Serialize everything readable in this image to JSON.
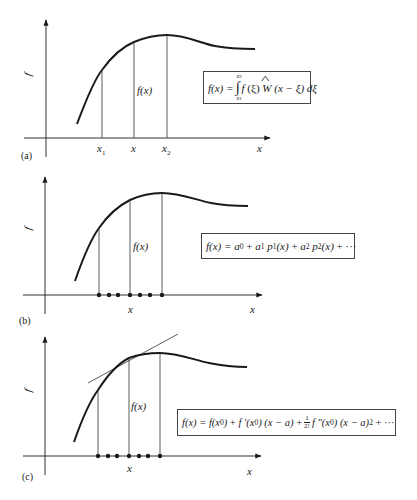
{
  "figure": {
    "panels": [
      {
        "id": "a",
        "panel_label": "(a)",
        "y_axis_label": "f",
        "x_axis_label": "x",
        "curve_label": "f(x)",
        "tick_labels": [
          "x1",
          "x",
          "x2"
        ],
        "tick_label_parts": [
          {
            "base": "x",
            "sub": "1"
          },
          {
            "base": "x",
            "sub": ""
          },
          {
            "base": "x",
            "sub": "2"
          }
        ],
        "formula": {
          "lhs": "f(x) =",
          "integral_upper": "x2",
          "integral_lower": "x1",
          "integrand": "f (ξ) Ŵ (x − ξ) dξ",
          "full_text": "f(x) = ∫_{x1}^{x2} f(ξ) Ŵ(x − ξ) dξ"
        }
      },
      {
        "id": "b",
        "panel_label": "(b)",
        "y_axis_label": "f",
        "x_axis_label": "x",
        "curve_label": "f(x)",
        "tick_labels": [
          "x"
        ],
        "sample_points": 7,
        "formula": {
          "full_text": "f(x) = a0 + a1 p1(x) + a2 p2(x) + ···"
        }
      },
      {
        "id": "c",
        "panel_label": "(c)",
        "y_axis_label": "f",
        "x_axis_label": "x",
        "curve_label": "f(x)",
        "tick_labels": [
          "x"
        ],
        "sample_points": 7,
        "has_tangent_line": true,
        "formula": {
          "full_text": "f(x) = f(x0) + f′(x0) (x − a) + 1/2! f″(x0) (x − a)^2 + ···"
        }
      }
    ]
  },
  "text": {
    "a_label": "(a)",
    "b_label": "(b)",
    "c_label": "(c)",
    "f": "f",
    "x": "x",
    "fx": "f(x)",
    "x_base": "x",
    "sub1": "1",
    "sub2": "2",
    "sub0": "0",
    "fx_eq": "f(x) =",
    "f_open": "f",
    "xi_part": "(ξ)",
    "W": "W",
    "w_arg": "(x − ξ) dξ",
    "xi_low": "x",
    "a0": "a",
    "plus": "+",
    "a1": "a",
    "p1": "p",
    "arg_x": "(x)",
    "ellipsis": "+ ···",
    "fx0": "f(x",
    "close": ")",
    "fprime": "f ′(x",
    "xma": "(x − a)",
    "one": "1",
    "twofact": "2!",
    "fdprime": "f ″(x",
    "sq": "2",
    "ellipsis2": "+ ···"
  },
  "colors": {
    "stroke": "#1a1a1a",
    "thin_stroke": "#333333",
    "background": "#ffffff"
  }
}
